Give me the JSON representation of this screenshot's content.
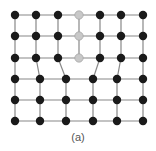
{
  "figure": {
    "caption": "(a)",
    "colors": {
      "atom": "#1a1a1a",
      "extra_atom": "#c8c8c8",
      "bond": "#888888"
    },
    "top_rows": {
      "y": [
        15,
        36,
        58
      ],
      "x": [
        15,
        36,
        58,
        79,
        100,
        121,
        143
      ],
      "extra_index": 3
    },
    "bottom_rows": {
      "y": [
        79,
        100,
        121
      ],
      "x": [
        15,
        40,
        66,
        93,
        117,
        143
      ]
    },
    "connections": [
      [
        0,
        0
      ],
      [
        1,
        1
      ],
      [
        2,
        2
      ],
      [
        4,
        3
      ],
      [
        5,
        4
      ],
      [
        6,
        5
      ]
    ]
  }
}
